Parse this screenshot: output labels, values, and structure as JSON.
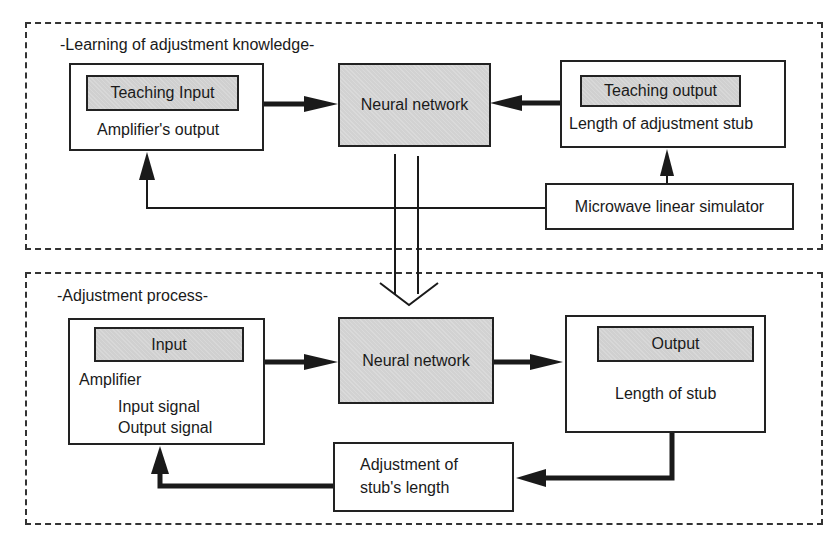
{
  "diagram": {
    "learning_section": {
      "title": "-Learning of adjustment knowledge-",
      "teaching_input_box": {
        "header": "Teaching Input",
        "label": "Amplifier's output"
      },
      "neural_network": {
        "label": "Neural network"
      },
      "teaching_output_box": {
        "header": "Teaching output",
        "label": "Length of adjustment stub"
      },
      "simulator_box": {
        "label": "Microwave linear simulator"
      }
    },
    "adjustment_section": {
      "title": "-Adjustment process-",
      "input_box": {
        "header": "Input",
        "label": "Amplifier",
        "line1": "Input signal",
        "line2": "Output signal"
      },
      "neural_network": {
        "label": "Neural network"
      },
      "output_box": {
        "header": "Output",
        "label": "Length of stub"
      },
      "adjustment_box": {
        "line1": "Adjustment of",
        "line2": "stub's length"
      }
    },
    "colors": {
      "line": "#222222",
      "gray_fill": "#d2d2d2",
      "background": "#ffffff"
    }
  }
}
